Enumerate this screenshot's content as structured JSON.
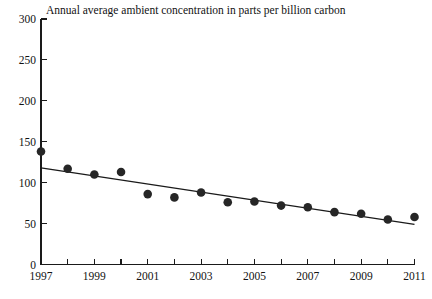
{
  "chart_data": {
    "type": "scatter",
    "title": "Annual average ambient concentration in parts per billion carbon",
    "xlabel": "",
    "ylabel": "",
    "xlim": [
      1997,
      2011
    ],
    "ylim": [
      0,
      300
    ],
    "grid": false,
    "legend": null,
    "x": [
      1997,
      1998,
      1999,
      2000,
      2001,
      2002,
      2003,
      2004,
      2005,
      2006,
      2007,
      2008,
      2009,
      2010,
      2011
    ],
    "values": [
      138,
      117,
      110,
      113,
      86,
      82,
      88,
      76,
      77,
      72,
      70,
      64,
      62,
      55,
      58
    ],
    "series": [
      {
        "name": "Annual average ambient concentration",
        "values": [
          138,
          117,
          110,
          113,
          86,
          82,
          88,
          76,
          77,
          72,
          70,
          64,
          62,
          55,
          58
        ]
      },
      {
        "name": "Trend line",
        "type": "line",
        "x": [
          1997,
          2011
        ],
        "values": [
          118,
          49
        ]
      }
    ],
    "y_ticks": [
      0,
      50,
      100,
      150,
      200,
      250,
      300
    ],
    "y_tick_labels": [
      "0",
      "50",
      "100",
      "150",
      "200",
      "250",
      "300"
    ],
    "x_ticks": [
      1997,
      1998,
      1999,
      2000,
      2001,
      2002,
      2003,
      2004,
      2005,
      2006,
      2007,
      2008,
      2009,
      2010,
      2011
    ],
    "x_tick_labels": [
      "1997",
      "",
      "1999",
      "",
      "2001",
      "",
      "2003",
      "",
      "2005",
      "",
      "2007",
      "",
      "2009",
      "",
      "2011"
    ],
    "marker_color": "#262626",
    "axis_color": "#1a1a1a",
    "background_color": "#ffffff"
  }
}
